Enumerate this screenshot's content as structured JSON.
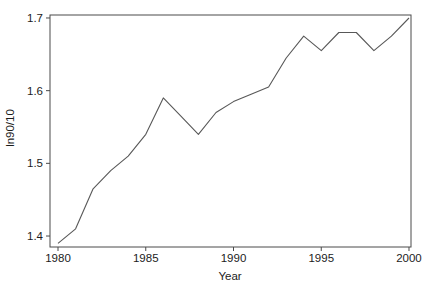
{
  "chart_data": {
    "type": "line",
    "title": "",
    "xlabel": "Year",
    "ylabel": "ln90/10",
    "x": [
      1980,
      1981,
      1982,
      1983,
      1984,
      1985,
      1986,
      1987,
      1988,
      1989,
      1990,
      1991,
      1992,
      1993,
      1994,
      1995,
      1996,
      1997,
      1998,
      1999,
      2000
    ],
    "values": [
      1.39,
      1.41,
      1.465,
      1.49,
      1.51,
      1.54,
      1.59,
      1.565,
      1.54,
      1.57,
      1.585,
      1.595,
      1.605,
      1.645,
      1.675,
      1.655,
      1.68,
      1.68,
      1.655,
      1.675,
      1.7
    ],
    "x_tick_labels": [
      "1980",
      "1985",
      "1990",
      "1995",
      "2000"
    ],
    "x_tick_values": [
      1980,
      1985,
      1990,
      1995,
      2000
    ],
    "y_tick_labels": [
      "1.4",
      "1.5",
      "1.6",
      "1.7"
    ],
    "y_tick_values": [
      1.4,
      1.5,
      1.6,
      1.7
    ],
    "xlim": [
      1979.544,
      2000.114
    ],
    "ylim": [
      1.3849,
      1.7041
    ],
    "grid": "off",
    "legend": "none",
    "line_color": "#585858",
    "axis_color": "#4a4a4a",
    "text_color": "#1c1c1c",
    "background_color": "#ffffff"
  }
}
